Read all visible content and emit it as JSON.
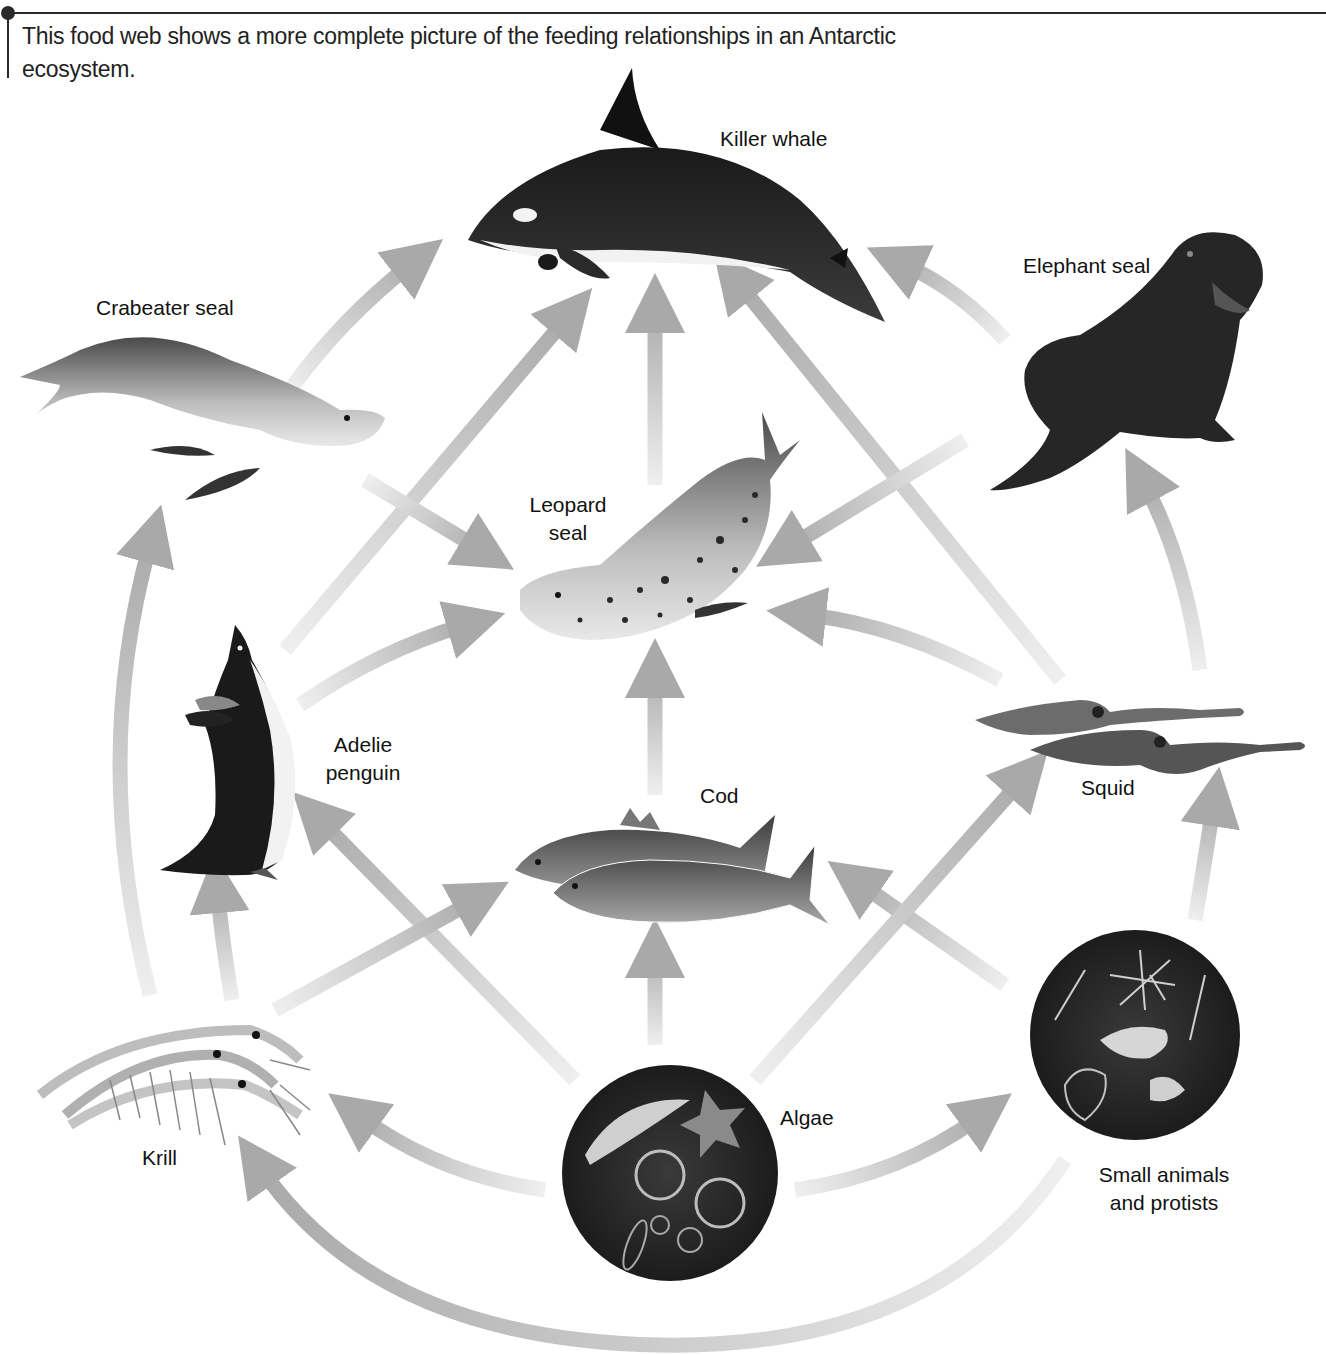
{
  "figure": {
    "caption": "This food web shows a more complete picture of the feeding relationships in an Antarctic ecosystem."
  },
  "organisms": {
    "killer_whale": {
      "label": "Killer whale",
      "trophic": "top predator"
    },
    "elephant_seal": {
      "label": "Elephant seal"
    },
    "crabeater_seal": {
      "label": "Crabeater seal"
    },
    "leopard_seal": {
      "label_line1": "Leopard",
      "label_line2": "seal"
    },
    "adelie_penguin": {
      "label_line1": "Adelie",
      "label_line2": "penguin"
    },
    "cod": {
      "label": "Cod"
    },
    "squid": {
      "label": "Squid"
    },
    "krill": {
      "label": "Krill"
    },
    "algae": {
      "label": "Algae"
    },
    "small_animals": {
      "label_line1": "Small animals",
      "label_line2": "and protists"
    }
  },
  "feeding_links": [
    {
      "from": "Crabeater seal",
      "to": "Killer whale"
    },
    {
      "from": "Adelie penguin",
      "to": "Killer whale"
    },
    {
      "from": "Leopard seal",
      "to": "Killer whale"
    },
    {
      "from": "Squid",
      "to": "Killer whale"
    },
    {
      "from": "Elephant seal",
      "to": "Killer whale"
    },
    {
      "from": "Crabeater seal",
      "to": "Leopard seal"
    },
    {
      "from": "Adelie penguin",
      "to": "Leopard seal"
    },
    {
      "from": "Cod",
      "to": "Leopard seal"
    },
    {
      "from": "Squid",
      "to": "Leopard seal"
    },
    {
      "from": "Elephant seal",
      "to": "Leopard seal"
    },
    {
      "from": "Squid",
      "to": "Elephant seal"
    },
    {
      "from": "Krill",
      "to": "Crabeater seal"
    },
    {
      "from": "Krill",
      "to": "Adelie penguin"
    },
    {
      "from": "Algae",
      "to": "Adelie penguin"
    },
    {
      "from": "Krill",
      "to": "Cod"
    },
    {
      "from": "Algae",
      "to": "Cod"
    },
    {
      "from": "Small animals and protists",
      "to": "Cod"
    },
    {
      "from": "Algae",
      "to": "Squid"
    },
    {
      "from": "Small animals and protists",
      "to": "Squid"
    },
    {
      "from": "Algae",
      "to": "Krill"
    },
    {
      "from": "Algae",
      "to": "Small animals and protists"
    },
    {
      "from": "Small animals and protists",
      "to": "Krill"
    }
  ],
  "colors": {
    "arrow_head": "#a9a9a9",
    "arrow_tail": "#eeeeee",
    "ink": "#111111",
    "rule": "#2a2a2a"
  }
}
